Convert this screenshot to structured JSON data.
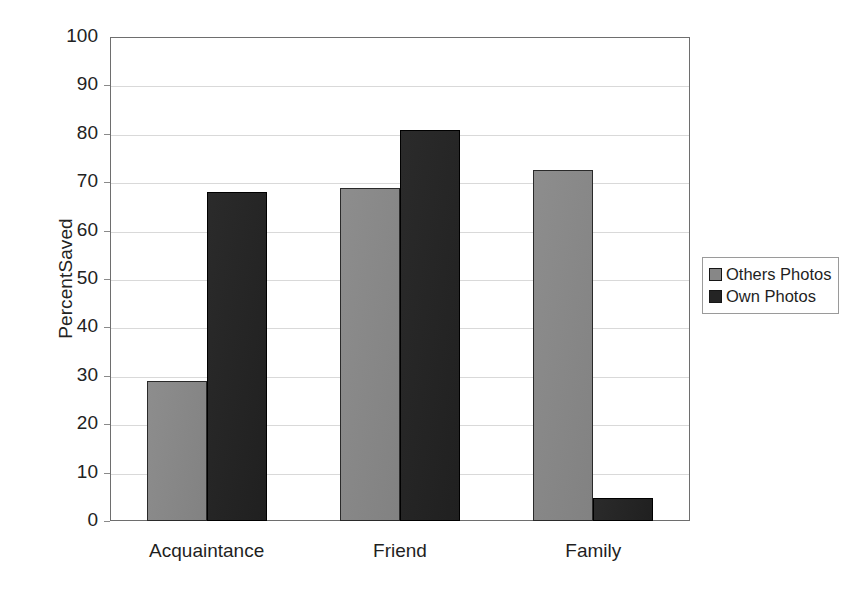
{
  "chart_data": {
    "type": "bar",
    "title": "",
    "subtitle": "",
    "xlabel": "",
    "ylabel": "PercentSaved",
    "categories": [
      "Acquaintance",
      "Friend",
      "Family"
    ],
    "series": [
      {
        "name": "Others Photos",
        "color": "#878787",
        "values": [
          29,
          68.8,
          72.5
        ]
      },
      {
        "name": "Own Photos",
        "color": "#222222",
        "values": [
          68,
          80.7,
          4.7
        ]
      }
    ],
    "ylim": [
      0,
      100
    ],
    "ytick_step": 10,
    "yticks": [
      0,
      10,
      20,
      30,
      40,
      50,
      60,
      70,
      80,
      90,
      100
    ],
    "ytick_labels": [
      "0",
      "10",
      "20",
      "30",
      "40",
      "50",
      "60",
      "70",
      "80",
      "90",
      "100"
    ],
    "grid": "horizontal",
    "legend_position": "right",
    "plot_background": "#ffffff",
    "grid_color": "#d9d9d9",
    "axis_color": "#6e6e6e"
  },
  "legend": {
    "entries": [
      {
        "label": "Others Photos",
        "swatch": "series-others"
      },
      {
        "label": "Own Photos",
        "swatch": "series-own"
      }
    ]
  }
}
